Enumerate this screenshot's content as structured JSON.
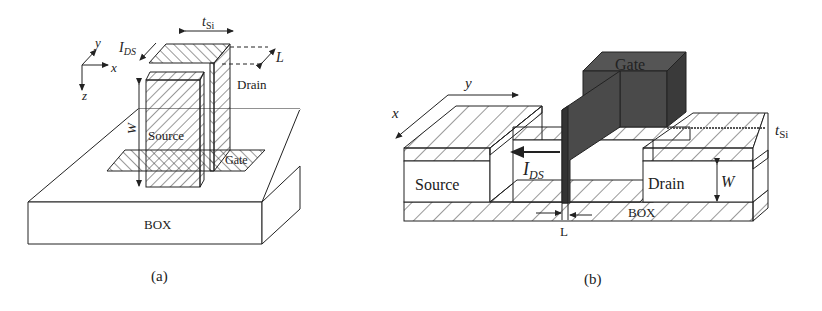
{
  "figure_a": {
    "caption": "(a)",
    "axes": {
      "x": "x",
      "y": "y",
      "z": "z"
    },
    "labels": {
      "ids": "I",
      "ids_sub": "DS",
      "tsi": "t",
      "tsi_sub": "Si",
      "L": "L",
      "drain": "Drain",
      "source": "Source",
      "gate": "Gate",
      "W": "W",
      "box": "BOX"
    }
  },
  "figure_b": {
    "caption": "(b)",
    "axes": {
      "x": "x",
      "y": "y"
    },
    "labels": {
      "gate": "Gate",
      "tsi": "t",
      "tsi_sub": "Si",
      "ids": "I",
      "ids_sub": "DS",
      "source": "Source",
      "drain": "Drain",
      "W": "W",
      "box": "BOX",
      "L": "L"
    }
  },
  "colors": {
    "line": "#222222",
    "gate_fill": "#4a4a4a",
    "gate_dark": "#3a3a3a",
    "background": "#ffffff"
  }
}
